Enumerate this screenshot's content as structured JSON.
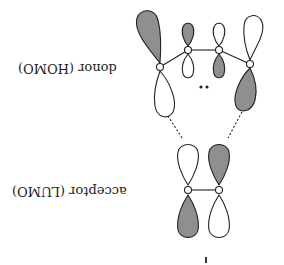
{
  "orientation": "rotated 180 degrees",
  "labels": {
    "donor": "donor (HOMO)",
    "acceptor": "acceptor (LUMO)",
    "lone_pair": "••"
  },
  "colors": {
    "shaded_lobe": "#8f8f8f",
    "unshaded_lobe": "#ffffff",
    "stroke": "#222222",
    "background": "#ffffff"
  },
  "donor_homo": {
    "atoms": 4,
    "description": "four-atom HOMO with p-orbital lobes, lone pair dots in the center"
  },
  "acceptor_lumo": {
    "atoms": 2,
    "description": "two-atom LUMO with p-orbital lobes"
  },
  "interactions": {
    "dashed_lines": 2,
    "description": "dashed lines connect terminal donor lobes to acceptor lobes"
  }
}
